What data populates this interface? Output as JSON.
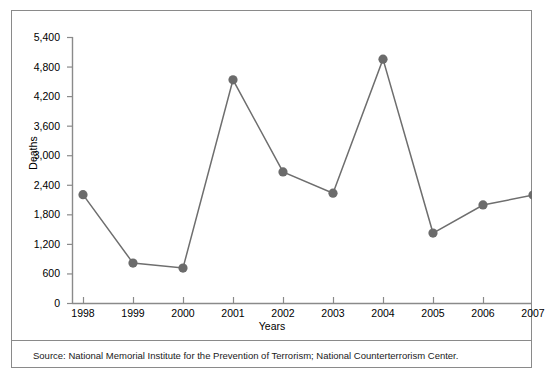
{
  "chart_data": {
    "type": "line",
    "title": "",
    "xlabel": "Years",
    "ylabel": "Deaths",
    "categories": [
      "1998",
      "1999",
      "2000",
      "2001",
      "2002",
      "2003",
      "2004",
      "2005",
      "2006",
      "2007"
    ],
    "values": [
      2200,
      810,
      710,
      4530,
      2660,
      2230,
      4950,
      1420,
      1990,
      2190
    ],
    "series": [
      {
        "name": "Deaths",
        "values": [
          2200,
          810,
          710,
          4530,
          2660,
          2230,
          4950,
          1420,
          1990,
          2190
        ]
      }
    ],
    "x": [
      1998,
      1999,
      2000,
      2001,
      2002,
      2003,
      2004,
      2005,
      2006,
      2007
    ],
    "ylim": [
      0,
      5400
    ],
    "yticks": [
      0,
      600,
      1200,
      1800,
      2400,
      3000,
      3600,
      4200,
      4800,
      5400
    ],
    "ytick_labels": [
      "0",
      "600",
      "1,200",
      "1,800",
      "2,400",
      "3,000",
      "3,600",
      "4,200",
      "4,800",
      "5,400"
    ],
    "xtick_labels": [
      "1998",
      "1999",
      "2000",
      "2001",
      "2002",
      "2003",
      "2004",
      "2005",
      "2006",
      "2007"
    ],
    "grid": false,
    "legend": "none",
    "line_color": "#6e6e6e",
    "marker_color": "#6b6b6b",
    "marker_shape": "circle",
    "axis_color": "#8a8a8a",
    "background_color": "#ffffff"
  },
  "footer": {
    "source_note": "Source: National Memorial Institute for the Prevention of Terrorism; National Counterterrorism Center."
  }
}
